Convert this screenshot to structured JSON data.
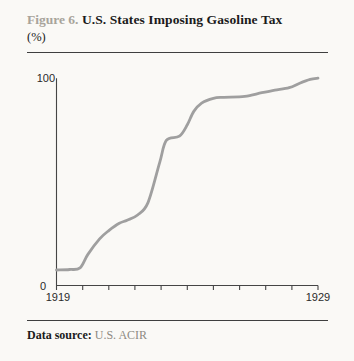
{
  "header": {
    "figure_label": "Figure 6.",
    "title": "U.S. States Imposing Gasoline Tax",
    "unit": "(%)"
  },
  "axis": {
    "y_max_label": "100",
    "y_min_label": "0",
    "x_first_label": "1919",
    "x_last_label": "1929"
  },
  "footer": {
    "source_label": "Data source:",
    "source_value": "U.S. ACIR"
  },
  "colors": {
    "background": "#faf9f6",
    "line": "#9f9f9f",
    "axis": "#454545",
    "rule": "#3f3f3f",
    "title_text": "#1b1b1b",
    "figure_label_text": "#a8a49b",
    "axis_label_text": "#2a2a2a",
    "source_muted_text": "#8e8a82"
  },
  "chart_data": {
    "type": "line",
    "title": "U.S. States Imposing Gasoline Tax",
    "ylabel": "% of U.S. states",
    "xlabel": "year",
    "xlim": [
      1919,
      1929
    ],
    "ylim": [
      0,
      100
    ],
    "x_ticks_every": 1,
    "visible_x_tick_labels": [
      "1919",
      "1929"
    ],
    "visible_y_tick_labels": [
      "0",
      "100"
    ],
    "grid": false,
    "legend": false,
    "series": [
      {
        "name": "Share of U.S. states imposing a gasoline tax (%)",
        "x": [
          1919,
          1919.5,
          1919.9,
          1920.2,
          1920.65,
          1921,
          1921.4,
          1921.7,
          1922.1,
          1922.5,
          1922.95,
          1923.2,
          1923.7,
          1924,
          1924.25,
          1924.55,
          1925,
          1925.4,
          1926.2,
          1926.85,
          1927.35,
          1927.9,
          1928.3,
          1928.7,
          1929
        ],
        "y": [
          7.5,
          7.7,
          8.5,
          15,
          22.5,
          26.5,
          30,
          31.5,
          34,
          40,
          59.5,
          70,
          72,
          77.5,
          84,
          88,
          90.3,
          90.8,
          91.2,
          93,
          94.2,
          95.4,
          97.6,
          99.4,
          100
        ]
      }
    ],
    "estimated_values_at_year": {
      "1919": 8,
      "1920": 11,
      "1921": 26,
      "1922": 34,
      "1923": 62,
      "1924": 78,
      "1925": 90,
      "1926": 91,
      "1927": 94,
      "1928": 96,
      "1929": 100
    }
  }
}
